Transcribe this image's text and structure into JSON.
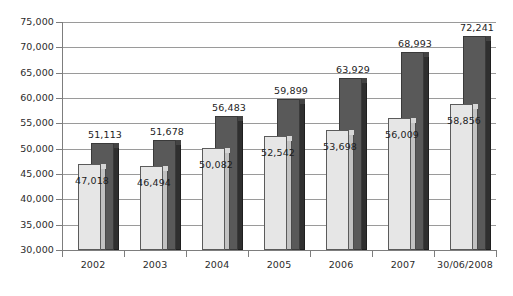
{
  "chart_data": {
    "type": "bar",
    "title": "",
    "subtitle": "",
    "xlabel": "",
    "ylabel": "",
    "ylim": [
      30000,
      75000
    ],
    "ytick_step": 5000,
    "grid": true,
    "legend": "none",
    "categories": [
      "2002",
      "2003",
      "2004",
      "2005",
      "2006",
      "2007",
      "30/06/2008"
    ],
    "series": [
      {
        "name": "light-series",
        "color": "#e6e6e6",
        "values": [
          47018,
          46494,
          50082,
          52542,
          53698,
          56009,
          58856
        ],
        "labels": [
          "47,018",
          "46,494",
          "50,082",
          "52,542",
          "53,698",
          "56,009",
          "58,856"
        ]
      },
      {
        "name": "dark-series",
        "color": "#595959",
        "values": [
          51113,
          51678,
          56483,
          59899,
          63929,
          68993,
          72241
        ],
        "labels": [
          "51,113",
          "51,678",
          "56,483",
          "59,899",
          "63,929",
          "68,993",
          "72,241"
        ]
      }
    ],
    "ytick_labels": [
      "75,000",
      "70,000",
      "65,000",
      "60,000",
      "55,000",
      "50,000",
      "45,000",
      "40,000",
      "35,000",
      "30,000"
    ],
    "ytick_values": [
      75000,
      70000,
      65000,
      60000,
      55000,
      50000,
      45000,
      40000,
      35000,
      30000
    ]
  },
  "colors": {
    "light_bar": "#e6e6e6",
    "light_bar_side": "#c2c2c2",
    "dark_bar": "#595959",
    "dark_bar_side": "#2f2f2f",
    "gridline": "#9a9a9a",
    "axis": "#7d7d7d",
    "text": "#2b2b2b",
    "background": "#ffffff"
  }
}
